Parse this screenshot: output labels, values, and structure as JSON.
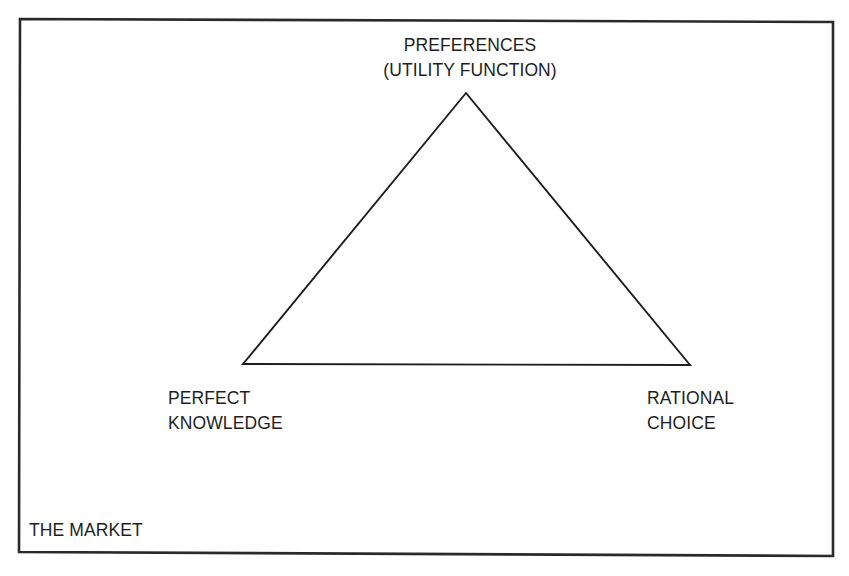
{
  "diagram": {
    "type": "triangle-concept-diagram",
    "frame": {
      "label": "THE MARKET",
      "border_color": "#2a2a2a"
    },
    "triangle": {
      "stroke_color": "#1e1e1e",
      "vertices": {
        "top": {
          "label_lines": [
            "PREFERENCES",
            "(UTILITY FUNCTION)"
          ]
        },
        "bottom_left": {
          "label_lines": [
            "PERFECT",
            "KNOWLEDGE"
          ]
        },
        "bottom_right": {
          "label_lines": [
            "RATIONAL",
            "CHOICE"
          ]
        }
      }
    }
  }
}
